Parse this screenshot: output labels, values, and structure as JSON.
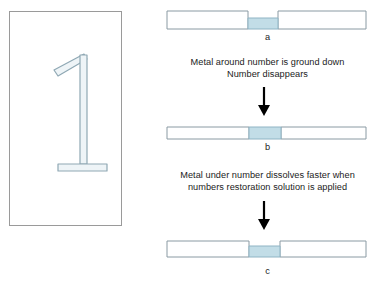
{
  "figure": {
    "background_color": "#ffffff",
    "metal_fill": "#ffffff",
    "metal_stroke": "#8a9aa3",
    "deformed_zone_fill": "#c2dde7",
    "deformed_zone_stroke": "#8fb4c4",
    "text_color": "#1b1b1b",
    "arrow_color": "#000000",
    "numeral_fill": "#eef4f7",
    "numeral_stroke": "#8fa8b4"
  },
  "numeral_panel": {
    "name": "stamped-number-illustration",
    "numeral": "1",
    "description": "stamped numeral one shown as three outlined strokes"
  },
  "stages": [
    {
      "id": "a",
      "label": "a",
      "state": "notched",
      "description": "metal surface with stamped number zone recessed below original surface"
    },
    {
      "id": "b",
      "label": "b",
      "state": "flat",
      "description": "ground flat bar with deformed metal zone flush at surface"
    },
    {
      "id": "c",
      "label": "c",
      "state": "etched",
      "description": "deformed metal under number dissolved faster leaving a recess"
    }
  ],
  "captions": [
    {
      "id": "caption-1",
      "lines": [
        "Metal around number is ground down",
        "Number disappears"
      ]
    },
    {
      "id": "caption-2",
      "lines": [
        "Metal under number dissolves faster when",
        "numbers restoration solution is applied"
      ]
    }
  ],
  "arrows": [
    {
      "id": "arrow-1",
      "direction": "down"
    },
    {
      "id": "arrow-2",
      "direction": "down"
    }
  ]
}
